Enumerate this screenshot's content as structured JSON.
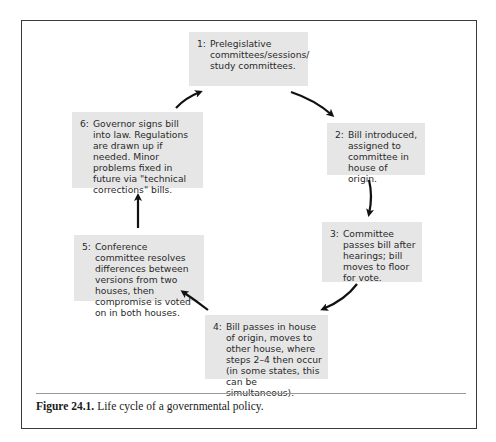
{
  "figure": {
    "caption_label": "Figure 24.1.",
    "caption_text": " Life cycle of a governmental policy.",
    "colors": {
      "box_fill": "#e6e6e6",
      "frame": "#3a3a3a",
      "arrow": "#111111",
      "rule": "#9a9a9a"
    }
  },
  "steps": [
    {
      "num": "1:",
      "text": "Prelegislative committees/sessions/ study committees."
    },
    {
      "num": "2:",
      "text": "Bill introduced, assigned to committee in house of origin."
    },
    {
      "num": "3:",
      "text": "Committee passes bill after hearings; bill moves to floor for vote."
    },
    {
      "num": "4:",
      "text": "Bill passes in house of origin, moves to other house, where steps 2–4 then occur (in some states, this can be simultaneous)."
    },
    {
      "num": "5:",
      "text": "Conference committee resolves differences between versions from two houses, then compromise is voted on in both houses."
    },
    {
      "num": "6:",
      "text": "Governor signs bill into law. Regulations are drawn up if needed. Minor problems fixed in future via \"technical corrections\" bills."
    }
  ],
  "flow": [
    {
      "from": 1,
      "to": 2
    },
    {
      "from": 2,
      "to": 3
    },
    {
      "from": 3,
      "to": 4
    },
    {
      "from": 4,
      "to": 5
    },
    {
      "from": 5,
      "to": 6
    },
    {
      "from": 6,
      "to": 1
    }
  ]
}
